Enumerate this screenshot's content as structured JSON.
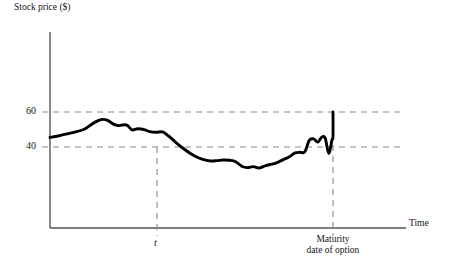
{
  "chart_data": {
    "type": "line",
    "title": "",
    "subtitle": "",
    "ylabel": "Stock price ($)",
    "xlabel": "Time",
    "ytick_labels": [
      "60",
      "40"
    ],
    "ytick_values": [
      60,
      40
    ],
    "xtick_labels": [
      "t",
      "Maturity\ndate of option"
    ],
    "x_annotation_1": "t",
    "x_annotation_2_line1": "Maturity",
    "x_annotation_2_line2": "date of option",
    "grid": "dashed reference lines at y=40 and y=60, dashed verticals at t and maturity",
    "legend": "none",
    "xlim": [
      0,
      1
    ],
    "ylim": [
      18,
      72
    ],
    "annotations": [
      {
        "label": "t",
        "x": 0.3,
        "type": "vertical-dashed-line"
      },
      {
        "label": "Maturity date of option",
        "x": 0.8,
        "type": "vertical-dashed-line"
      },
      {
        "label": "60",
        "y": 60,
        "type": "horizontal-dashed-line"
      },
      {
        "label": "40",
        "y": 40,
        "type": "horizontal-dashed-line"
      }
    ],
    "series": [
      {
        "name": "Stock price path",
        "color": "#000000",
        "x": [
          0.0,
          0.022,
          0.045,
          0.07,
          0.095,
          0.115,
          0.133,
          0.148,
          0.163,
          0.178,
          0.192,
          0.205,
          0.218,
          0.232,
          0.248,
          0.265,
          0.282,
          0.3,
          0.318,
          0.337,
          0.357,
          0.378,
          0.398,
          0.418,
          0.437,
          0.455,
          0.472,
          0.49,
          0.508,
          0.525,
          0.542,
          0.558,
          0.575,
          0.592,
          0.61,
          0.628,
          0.645,
          0.662,
          0.678,
          0.693,
          0.707,
          0.72,
          0.733,
          0.745,
          0.757,
          0.768,
          0.778,
          0.788,
          0.797,
          0.8
        ],
        "y": [
          45.5,
          46.3,
          47.4,
          48.5,
          50.0,
          52.6,
          54.8,
          55.8,
          55.2,
          53.2,
          52.2,
          52.6,
          52.4,
          49.8,
          50.4,
          50.0,
          48.8,
          48.4,
          48.6,
          46.0,
          42.4,
          39.0,
          36.2,
          34.0,
          32.6,
          32.0,
          32.2,
          32.6,
          32.4,
          31.6,
          29.0,
          28.2,
          28.8,
          28.0,
          29.4,
          30.2,
          31.4,
          33.0,
          34.6,
          36.6,
          37.0,
          37.2,
          43.8,
          44.6,
          42.8,
          45.6,
          45.0,
          36.4,
          44.0,
          46.0
        ],
        "end_value": 60,
        "end_x": 0.8
      }
    ]
  },
  "colors": {
    "curve": "#000000",
    "axis": "#555555",
    "gridline": "#8a8a8a",
    "text": "#151515",
    "background": "#ffffff"
  }
}
